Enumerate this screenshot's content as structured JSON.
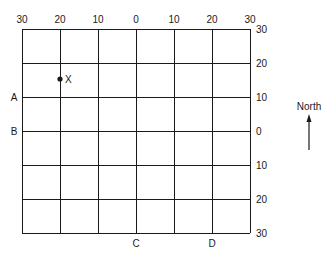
{
  "diagram": {
    "type": "grid-map",
    "grid": {
      "columns": 6,
      "rows": 6,
      "line_color": "#1a1a1a",
      "background": "#ffffff"
    },
    "top_axis": {
      "ticks": [
        "30",
        "20",
        "10",
        "0",
        "10",
        "20",
        "30"
      ]
    },
    "right_axis": {
      "ticks": [
        "30",
        "20",
        "10",
        "0",
        "10",
        "20",
        "30"
      ]
    },
    "left_markers": [
      {
        "label": "A",
        "row_line": 2
      },
      {
        "label": "B",
        "row_line": 3
      }
    ],
    "bottom_markers": [
      {
        "label": "C",
        "col_line": 3
      },
      {
        "label": "D",
        "col_line": 5
      }
    ],
    "point": {
      "label": "X",
      "grid_x": "20 (west)",
      "grid_y": "15 (north)",
      "color": "#1a1a1a"
    },
    "compass": {
      "label": "North",
      "direction": "up"
    }
  }
}
